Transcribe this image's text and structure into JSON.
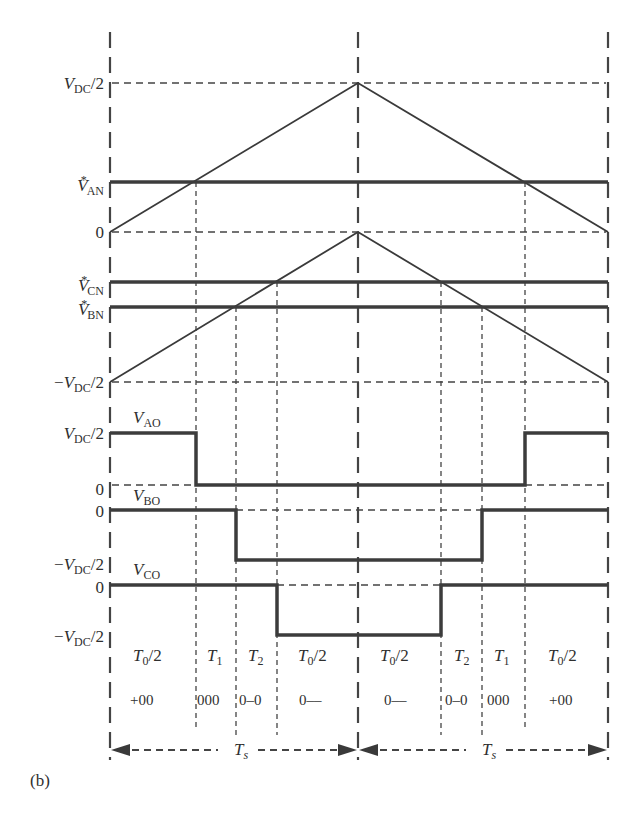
{
  "figure": {
    "panel_label": "(b)"
  },
  "y_axis_labels": {
    "carrier_top": {
      "sym": "V",
      "sub": "DC",
      "suffix": "/2"
    },
    "van_ref": {
      "sym": "V",
      "sup": "*",
      "sub": "AN"
    },
    "zero_1": "0",
    "vcn_ref": {
      "sym": "V",
      "sup": "*",
      "sub": "CN"
    },
    "vbn_ref": {
      "sym": "V",
      "sup": "*",
      "sub": "BN"
    },
    "carrier2_bottom": {
      "prefix": "−",
      "sym": "V",
      "sub": "DC",
      "suffix": "/2"
    },
    "vao_high": {
      "sym": "V",
      "sub": "DC",
      "suffix": "/2"
    },
    "vao_zero": "0",
    "vbo_zero": "0",
    "vbo_low": {
      "prefix": "−",
      "sym": "V",
      "sub": "DC",
      "suffix": "/2"
    },
    "vco_zero": "0",
    "vco_low": {
      "prefix": "−",
      "sym": "V",
      "sub": "DC",
      "suffix": "/2"
    }
  },
  "waveform_labels": {
    "vao": {
      "sym": "V",
      "sub": "AO"
    },
    "vbo": {
      "sym": "V",
      "sub": "BO"
    },
    "vco": {
      "sym": "V",
      "sub": "CO"
    }
  },
  "intervals": [
    {
      "label": "T",
      "sub": "0",
      "suffix": "/2",
      "state": "+00"
    },
    {
      "label": "T",
      "sub": "1",
      "suffix": "",
      "state": "000"
    },
    {
      "label": "T",
      "sub": "2",
      "suffix": "",
      "state": "0–0"
    },
    {
      "label": "T",
      "sub": "0",
      "suffix": "/2",
      "state": "0––"
    },
    {
      "label": "T",
      "sub": "0",
      "suffix": "/2",
      "state": "0––"
    },
    {
      "label": "T",
      "sub": "2",
      "suffix": "",
      "state": "0–0"
    },
    {
      "label": "T",
      "sub": "1",
      "suffix": "",
      "state": "000"
    },
    {
      "label": "T",
      "sub": "0",
      "suffix": "/2",
      "state": "+00"
    }
  ],
  "period_labels": [
    {
      "sym": "T",
      "sub": "s"
    },
    {
      "sym": "T",
      "sub": "s"
    }
  ],
  "colors": {
    "line": "#3a3a3a",
    "thick": "#3c3c3c",
    "background": "#ffffff"
  }
}
